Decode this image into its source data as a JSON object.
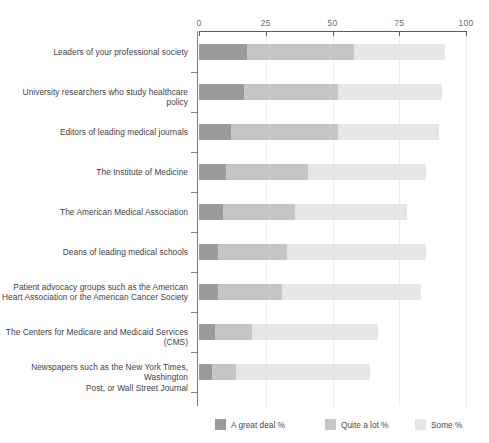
{
  "chart_data": {
    "type": "bar",
    "title": "",
    "subtitle": "",
    "xlabel": "",
    "ylabel": "",
    "orientation": "horizontal",
    "stacked": true,
    "xlim": [
      0,
      100
    ],
    "xticks": [
      0,
      25,
      50,
      75,
      100
    ],
    "xtick_labels": [
      "0",
      "25",
      "50",
      "75",
      "100"
    ],
    "grid": true,
    "legend_position": "bottom",
    "categories": [
      "Leaders of your professional society",
      "University researchers who study healthcare policy",
      "Editors of leading medical journals",
      "The Institute of Medicine",
      "The American Medical Association",
      "Deans of leading medical schools",
      "Patient advocacy groups such as the American Heart Association or the American Cancer Society",
      "The Centers for Medicare and Medicaid Services (CMS)",
      "Newspapers such as the New York Times, Washington Post, or Wall Street Journal"
    ],
    "category_lines": [
      [
        "Leaders of your professional society"
      ],
      [
        "University researchers who study healthcare policy"
      ],
      [
        "Editors of leading medical journals"
      ],
      [
        "The Institute of Medicine"
      ],
      [
        "The American Medical Association"
      ],
      [
        "Deans of leading medical schools"
      ],
      [
        "Patient advocacy groups such as the American",
        "Heart Association or the American Cancer Society"
      ],
      [
        "The Centers for Medicare and Medicaid Services (CMS)"
      ],
      [
        "Newspapers such as the New York Times, Washington",
        "Post, or Wall Street Journal"
      ]
    ],
    "series": [
      {
        "name": "A great deal %",
        "color": "#9a9a9a",
        "values": [
          18,
          17,
          12,
          10,
          9,
          7,
          7,
          6,
          5
        ]
      },
      {
        "name": "Quite a lot %",
        "color": "#c6c6c6",
        "values": [
          40,
          35,
          40,
          31,
          27,
          26,
          24,
          14,
          9
        ]
      },
      {
        "name": "Some %",
        "color": "#e6e6e6",
        "values": [
          34,
          39,
          38,
          44,
          42,
          52,
          52,
          47,
          50
        ]
      }
    ],
    "totals": [
      92,
      91,
      90,
      85,
      78,
      85,
      83,
      67,
      64
    ]
  },
  "legend": {
    "items": [
      {
        "label": "A great deal %",
        "color": "#9a9a9a"
      },
      {
        "label": "Quite a lot %",
        "color": "#c6c6c6"
      },
      {
        "label": "Some %",
        "color": "#e6e6e6"
      }
    ]
  }
}
